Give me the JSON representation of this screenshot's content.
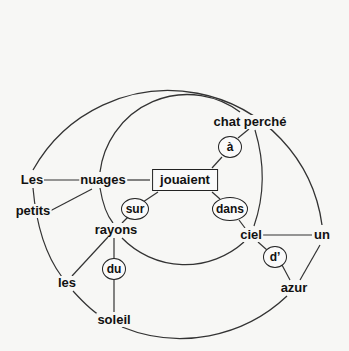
{
  "diagram": {
    "type": "concentric sentence diagram",
    "center": {
      "id": "jouaient",
      "label": "jouaient",
      "x": 185,
      "y": 180
    },
    "words": [
      {
        "id": "chat_perche",
        "label": "chat perché",
        "x": 250,
        "y": 122
      },
      {
        "id": "les_cap",
        "label": "Les",
        "x": 32,
        "y": 180
      },
      {
        "id": "nuages",
        "label": "nuages",
        "x": 103,
        "y": 180
      },
      {
        "id": "petits",
        "label": "petits",
        "x": 33,
        "y": 211
      },
      {
        "id": "rayons",
        "label": "rayons",
        "x": 116,
        "y": 230
      },
      {
        "id": "ciel",
        "label": "ciel",
        "x": 251,
        "y": 235
      },
      {
        "id": "un",
        "label": "un",
        "x": 322,
        "y": 235
      },
      {
        "id": "les",
        "label": "les",
        "x": 67,
        "y": 283
      },
      {
        "id": "azur",
        "label": "azur",
        "x": 294,
        "y": 288
      },
      {
        "id": "soleil",
        "label": "soleil",
        "x": 114,
        "y": 320
      }
    ],
    "prepositions": [
      {
        "id": "a",
        "label": "à",
        "x": 230,
        "y": 147
      },
      {
        "id": "sur",
        "label": "sur",
        "x": 135,
        "y": 209
      },
      {
        "id": "dans",
        "label": "dans",
        "x": 230,
        "y": 209
      },
      {
        "id": "du",
        "label": "du",
        "x": 114,
        "y": 269
      },
      {
        "id": "d",
        "label": "d’",
        "x": 275,
        "y": 257
      }
    ],
    "circles": [
      {
        "name": "inner",
        "cx": 185,
        "cy": 178,
        "r": 88
      },
      {
        "name": "outer",
        "cx": 184,
        "cy": 177,
        "r": 155
      }
    ]
  }
}
